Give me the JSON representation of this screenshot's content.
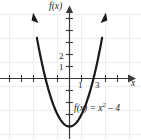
{
  "figure": {
    "name": "parabola-graph",
    "background_color": "#ffffff",
    "width": 141,
    "height": 139
  },
  "axes": {
    "y_axis_label": "f(x)",
    "x_axis_label": "x",
    "x_axis_y_px": 78,
    "y_axis_x_px": 69,
    "unit_px": 12,
    "grid": {
      "visible": true,
      "color": "#ededed",
      "spacing_px": 24
    },
    "axis_color": "#3a3a3a",
    "tick_length_px": 4
  },
  "ticks": {
    "y_labels": [
      {
        "name": "ytick-2",
        "text": "2"
      },
      {
        "name": "ytick-1",
        "text": "1"
      }
    ],
    "x_labels": [
      {
        "name": "xtick-1",
        "text": "1"
      },
      {
        "name": "xtick-3",
        "text": "3"
      }
    ]
  },
  "equation": {
    "prefix": "f(x) = x",
    "exponent": "2",
    "suffix": " – 4",
    "full_text": "f(x) = x² – 4"
  },
  "chart_data": {
    "type": "line",
    "title": "",
    "xlabel": "x",
    "ylabel": "f(x)",
    "function": "f(x) = x^2 - 4",
    "curve_color": "#1a1a1a",
    "curve_width_px": 2.2,
    "arrowheads": [
      "left-end-up",
      "right-end-up"
    ],
    "vertex": [
      0,
      -4
    ],
    "roots": [
      -2,
      2
    ],
    "xlim": [
      -5.75,
      6.0
    ],
    "ylim": [
      -5.4,
      5.3
    ],
    "x": [
      -2.7,
      -2.4,
      -2.1,
      -1.8,
      -1.5,
      -1.2,
      -0.9,
      -0.6,
      -0.3,
      0,
      0.3,
      0.6,
      0.9,
      1.2,
      1.5,
      1.8,
      2.1,
      2.4,
      2.7
    ],
    "y": [
      3.29,
      1.76,
      0.41,
      -0.76,
      -1.75,
      -2.56,
      -3.19,
      -3.64,
      -3.91,
      -4,
      -3.91,
      -3.64,
      -3.19,
      -2.56,
      -1.75,
      -0.76,
      0.41,
      1.76,
      3.29
    ],
    "grid": true,
    "legend": "none",
    "annotations": [
      {
        "text": "f(x) = x² – 4",
        "x_px": 74,
        "y_px": 104
      }
    ]
  }
}
